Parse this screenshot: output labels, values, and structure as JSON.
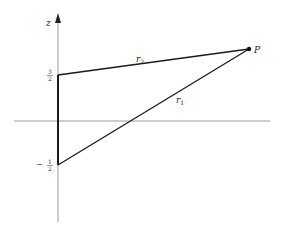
{
  "diagram": {
    "axis_label_z": "z",
    "point_label": "P",
    "r1_label": "r",
    "r1_sub": "1",
    "r2_label": "r",
    "r2_sub": "2",
    "tick_upper": {
      "sign": "",
      "num": "3",
      "den": "2"
    },
    "tick_lower": {
      "sign": "−",
      "num": "1",
      "den": "2"
    },
    "colors": {
      "axis": "#9a9a9a",
      "line": "#1a1a1a"
    }
  }
}
